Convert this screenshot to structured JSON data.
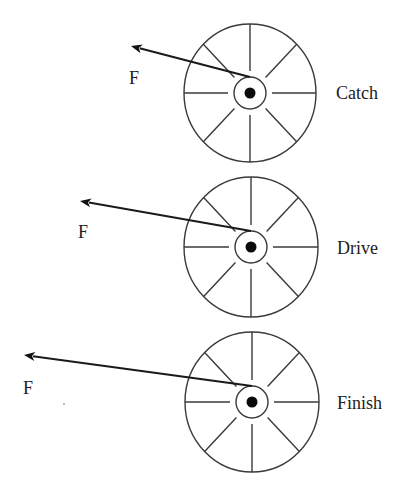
{
  "diagram": {
    "wheels": [
      {
        "phase_label": "Catch",
        "force_label": "F",
        "center": [
          250,
          93
        ],
        "rim_rx": 66,
        "rim_ry": 69,
        "hub_r": 16,
        "spoke_inner_r": 22,
        "dot_r": 5.5,
        "arrow_from": [
          250,
          77
        ],
        "arrow_tip": [
          131,
          46
        ],
        "force_label_pos": [
          129,
          84
        ],
        "phase_label_pos": [
          336,
          99
        ]
      },
      {
        "phase_label": "Drive",
        "force_label": "F",
        "center": [
          251,
          247
        ],
        "rim_rx": 67,
        "rim_ry": 70,
        "hub_r": 16,
        "spoke_inner_r": 22,
        "dot_r": 5.5,
        "arrow_from": [
          251,
          231
        ],
        "arrow_tip": [
          80,
          201
        ],
        "force_label_pos": [
          78,
          238
        ],
        "phase_label_pos": [
          337,
          254
        ]
      },
      {
        "phase_label": "Finish",
        "force_label": "F",
        "center": [
          252,
          402
        ],
        "rim_rx": 67,
        "rim_ry": 70,
        "hub_r": 16,
        "spoke_inner_r": 22,
        "dot_r": 5.5,
        "arrow_from": [
          252,
          386
        ],
        "arrow_tip": [
          24,
          355
        ],
        "force_label_pos": [
          23,
          394
        ],
        "phase_label_pos": [
          337,
          409
        ]
      }
    ],
    "colors": {
      "stroke": "#3a3a3a",
      "arrow": "#1a1a1a",
      "text": "#222222",
      "background": "#ffffff"
    }
  }
}
